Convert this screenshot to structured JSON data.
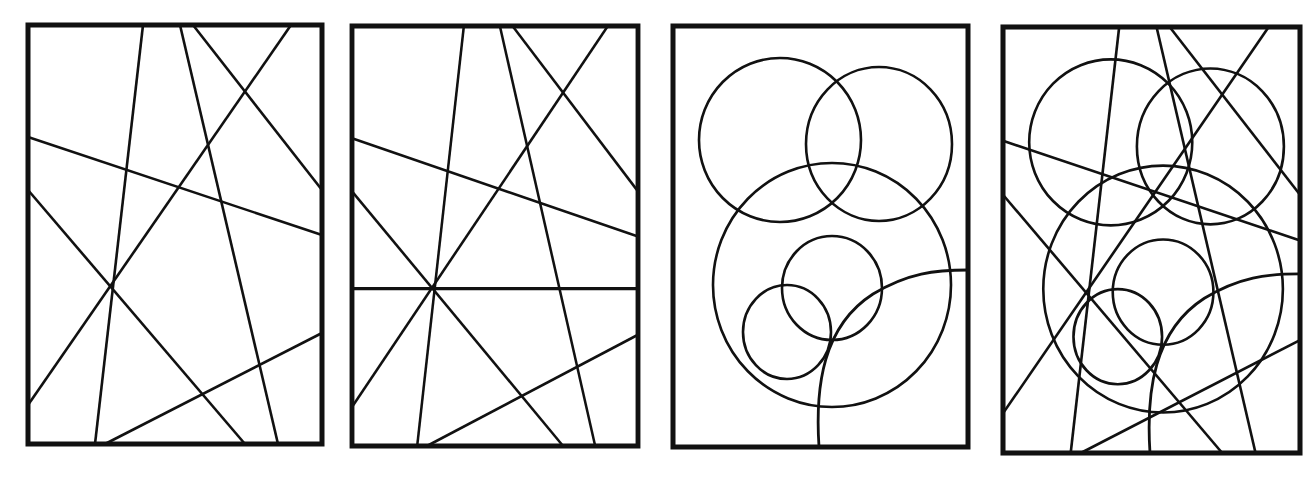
{
  "figure": {
    "stroke_color": "#111111",
    "background": "#ffffff",
    "panels": [
      {
        "id": "panel-1",
        "label": "straight lines",
        "x": 28,
        "y": 25,
        "w": 294,
        "h": 419
      },
      {
        "id": "panel-2",
        "label": "straight lines with horizontal line",
        "x": 352,
        "y": 26,
        "w": 286,
        "h": 420
      },
      {
        "id": "panel-3",
        "label": "circles",
        "x": 673,
        "y": 26,
        "w": 295,
        "h": 421
      },
      {
        "id": "panel-4",
        "label": "lines and circles combined",
        "x": 1003,
        "y": 27,
        "w": 297,
        "h": 426
      }
    ],
    "lines": [
      [
        115,
        0,
        67,
        419
      ],
      [
        152,
        0,
        250,
        419
      ],
      [
        165,
        0,
        294,
        165
      ],
      [
        263,
        0,
        0,
        380
      ],
      [
        0,
        112,
        294,
        210
      ],
      [
        0,
        165,
        217,
        419
      ],
      [
        294,
        308,
        77,
        419
      ]
    ],
    "horizontal_line_y": 262,
    "circles": [
      {
        "cx": 107,
        "cy": 114,
        "rx": 81,
        "ry": 82
      },
      {
        "cx": 206,
        "cy": 118,
        "rx": 73,
        "ry": 77
      },
      {
        "cx": 159,
        "cy": 259,
        "rx": 119,
        "ry": 122
      },
      {
        "cx": 159,
        "cy": 262,
        "rx": 50,
        "ry": 52
      },
      {
        "cx": 114,
        "cy": 306,
        "rx": 44,
        "ry": 47
      }
    ],
    "arc": "M146,421 C142,360 150,300 200,268 C235,247 262,244 295,244"
  }
}
